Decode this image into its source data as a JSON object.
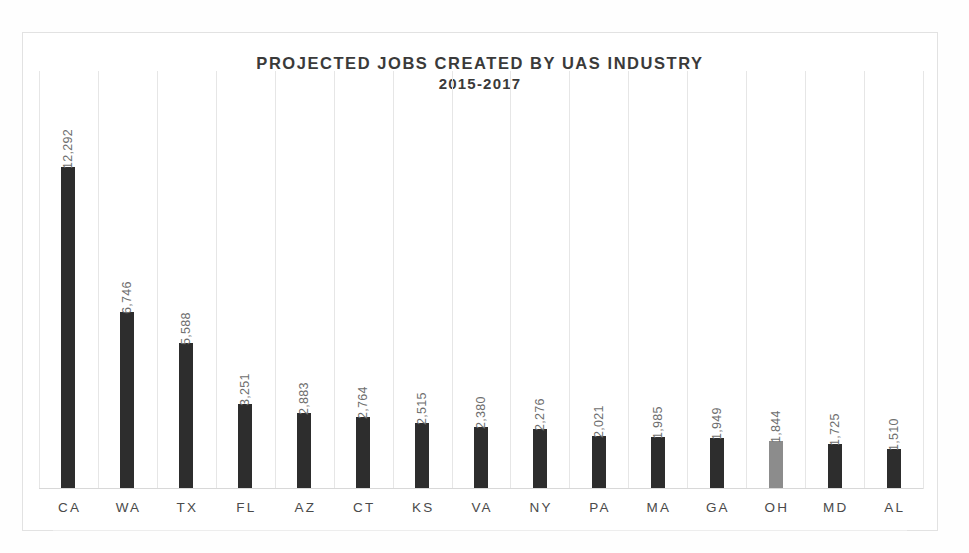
{
  "chart_data": {
    "type": "bar",
    "title": "PROJECTED JOBS CREATED BY UAS INDUSTRY",
    "subtitle": "2015-2017",
    "xlabel": "",
    "ylabel": "",
    "ylim": [
      0,
      12292
    ],
    "grid": "vertical-category-separators",
    "legend": "none",
    "orientation": "vertical",
    "value_label_rotation": -90,
    "categories": [
      "CA",
      "WA",
      "TX",
      "FL",
      "AZ",
      "CT",
      "KS",
      "VA",
      "NY",
      "PA",
      "MA",
      "GA",
      "OH",
      "MD",
      "AL"
    ],
    "values": [
      12292,
      6746,
      5588,
      3251,
      2883,
      2764,
      2515,
      2380,
      2276,
      2021,
      1985,
      1949,
      1844,
      1725,
      1510
    ],
    "value_labels": [
      "12,292",
      "6,746",
      "5,588",
      "3,251",
      "2,883",
      "2,764",
      "2,515",
      "2,380",
      "2,276",
      "2,021",
      "1,985",
      "1,949",
      "1,844",
      "1,725",
      "1,510"
    ],
    "bar_colors": [
      "#2d2d2d",
      "#2d2d2d",
      "#2d2d2d",
      "#2d2d2d",
      "#2d2d2d",
      "#2d2d2d",
      "#2d2d2d",
      "#2d2d2d",
      "#2d2d2d",
      "#2d2d2d",
      "#2d2d2d",
      "#2d2d2d",
      "#8c8c8c",
      "#2d2d2d",
      "#2d2d2d"
    ],
    "highlighted_category": "OH",
    "colors": {
      "bar_default": "#2d2d2d",
      "bar_highlight": "#8c8c8c",
      "title_text": "#3a3a3a",
      "value_text": "#6e6e6e",
      "category_text": "#4a4a4a",
      "gridline": "#e6e6e6",
      "frame": "#e2e2e2",
      "background": "#ffffff"
    }
  }
}
